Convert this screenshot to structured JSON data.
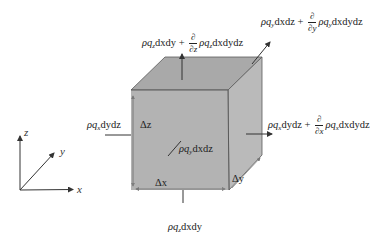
{
  "diagram": {
    "type": "control-volume-cube",
    "colors": {
      "front_face": "#b4b4b4",
      "top_face": "#a8a8a8",
      "right_face": "#bcbcbc",
      "edge": "#5a5a5a",
      "arrow": "#333333",
      "text": "#222222"
    },
    "axes": {
      "z_label": "z",
      "y_label": "y",
      "x_label": "x"
    },
    "dimensions": {
      "dz": "Δz",
      "dx": "Δx",
      "dy": "Δy"
    },
    "fluxes": {
      "top_out": {
        "base": "ρq",
        "sub": "z",
        "term1_tail": "dxdy + ",
        "partial_num": "∂",
        "partial_den": "∂z",
        "term2": "ρq",
        "term2_sub": "z",
        "term2_tail": "dxdydz"
      },
      "back_out": {
        "base": "ρq",
        "sub": "y",
        "term1_tail": "dxdz + ",
        "partial_num": "∂",
        "partial_den": "∂y",
        "term2": "ρq",
        "term2_sub": "y",
        "term2_tail": "dxdydz"
      },
      "right_out": {
        "base": "ρq",
        "sub": "x",
        "term1_tail": "dydz + ",
        "partial_num": "∂",
        "partial_den": "∂x",
        "term2": "ρq",
        "term2_sub": "x",
        "term2_tail": "dxdydz"
      },
      "left_in": {
        "base": "ρq",
        "sub": "x",
        "tail": "dydz"
      },
      "front_in": {
        "base": "ρq",
        "sub": "y",
        "tail": "dxdz"
      },
      "bottom_in": {
        "base": "ρq",
        "sub": "z",
        "tail": "dxdy"
      }
    }
  }
}
